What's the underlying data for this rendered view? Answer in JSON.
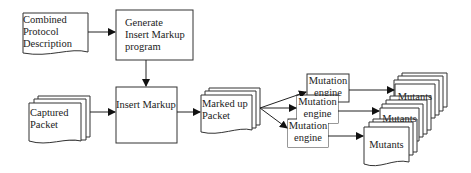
{
  "diagram": {
    "type": "flowchart",
    "nodes": {
      "combined_protocol": {
        "shape": "document",
        "lines": [
          "Combined",
          "Protocol",
          "Description"
        ]
      },
      "generate_program": {
        "shape": "process",
        "lines": [
          "Generate",
          "Insert Markup",
          "program"
        ]
      },
      "captured_packet": {
        "shape": "multi-document",
        "lines": [
          "Captured",
          "Packet"
        ]
      },
      "insert_markup": {
        "shape": "process",
        "lines": [
          "Insert Markup"
        ]
      },
      "marked_up_packet": {
        "shape": "multi-document",
        "lines": [
          "Marked up",
          "Packet"
        ]
      },
      "mutation_engines": [
        {
          "shape": "process",
          "lines": [
            "Mutation",
            "engine"
          ]
        },
        {
          "shape": "process",
          "lines": [
            "Mutation",
            "engine"
          ]
        },
        {
          "shape": "process",
          "lines": [
            "Mutation",
            "engine"
          ]
        }
      ],
      "mutants": [
        {
          "shape": "multi-document",
          "label": "Mutants"
        },
        {
          "shape": "multi-document",
          "label": "Mutants"
        },
        {
          "shape": "multi-document",
          "label": "Mutants"
        }
      ]
    },
    "edges": [
      {
        "from": "Combined Protocol Description",
        "to": "Generate Insert Markup program"
      },
      {
        "from": "Generate Insert Markup program",
        "to": "Insert Markup"
      },
      {
        "from": "Captured Packet",
        "to": "Insert Markup"
      },
      {
        "from": "Insert Markup",
        "to": "Marked up Packet"
      },
      {
        "from": "Marked up Packet",
        "to": "Mutation engine 1"
      },
      {
        "from": "Marked up Packet",
        "to": "Mutation engine 2"
      },
      {
        "from": "Marked up Packet",
        "to": "Mutation engine 3"
      },
      {
        "from": "Mutation engine 1",
        "to": "Mutants 1"
      },
      {
        "from": "Mutation engine 2",
        "to": "Mutants 2"
      },
      {
        "from": "Mutation engine 3",
        "to": "Mutants 3"
      }
    ],
    "colors": {
      "stroke": "#222222",
      "fill": "#ffffff",
      "text": "#222222"
    }
  }
}
